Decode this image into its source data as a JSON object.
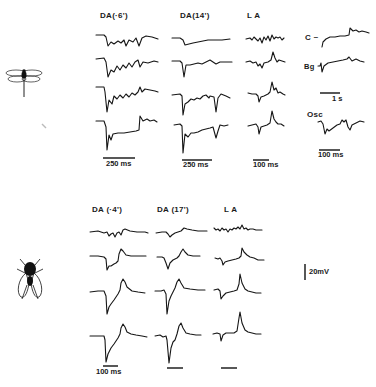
{
  "figure": {
    "top_panel": {
      "organism": "dragonfly",
      "columns": [
        {
          "label": "DA(·6')",
          "scale_bar": "250 ms"
        },
        {
          "label": "DA(14')",
          "scale_bar": "250 ms"
        },
        {
          "label": "L A",
          "scale_bar": "100 ms"
        }
      ],
      "inset": {
        "c_label": "C",
        "bg_label": "Bg",
        "scale_bar_1": "1 s",
        "osc_label": "Osc",
        "scale_bar_2": "100 ms"
      },
      "traces_per_column": 4
    },
    "bottom_panel": {
      "organism": "fly",
      "columns": [
        {
          "label": "DA (·4')",
          "scale_bar": "100 ms"
        },
        {
          "label": "DA (17')",
          "scale_bar": ""
        },
        {
          "label": "L A",
          "scale_bar": ""
        }
      ],
      "traces_per_column": 4,
      "voltage_scale": "20mV"
    }
  }
}
